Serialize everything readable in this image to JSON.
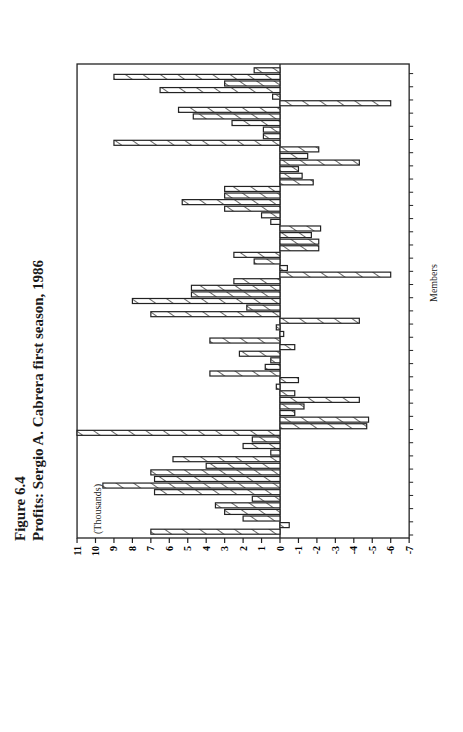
{
  "chart_data": {
    "type": "bar",
    "title": "Figure 6.4",
    "subtitle": "Profits: Sergio A. Cabrera first season, 1986",
    "xlabel": "Members",
    "ylabel": "(Thousands)",
    "ylim": [
      -7,
      11
    ],
    "yticks": [
      11,
      10,
      9,
      8,
      7,
      6,
      5,
      4,
      3,
      2,
      1,
      0,
      -1,
      -2,
      -3,
      -4,
      -5,
      -6,
      -7
    ],
    "grid": false,
    "legend": null,
    "orientation": "vertical bars, page rotated 90 degrees",
    "bar_style": "hatched",
    "categories_note": "individual members, unlabeled",
    "values": [
      7.0,
      -0.5,
      2.0,
      3.0,
      3.5,
      1.5,
      6.8,
      9.6,
      6.8,
      7.0,
      4.0,
      5.8,
      0.5,
      2.0,
      1.5,
      11.0,
      -4.7,
      -4.8,
      -0.8,
      -1.3,
      -4.3,
      -0.8,
      0.2,
      -1.0,
      3.8,
      0.8,
      0.5,
      2.2,
      -0.8,
      3.8,
      -0.2,
      0.2,
      -4.3,
      7.0,
      1.8,
      8.0,
      4.8,
      4.8,
      2.5,
      -6.0,
      -0.4,
      1.4,
      2.5,
      -2.1,
      -2.1,
      -1.7,
      -2.2,
      0.5,
      1.0,
      3.0,
      5.3,
      3.0,
      3.0,
      -1.8,
      -1.2,
      -1.0,
      -4.3,
      -1.5,
      -2.1,
      9.0,
      0.9,
      0.9,
      2.6,
      4.7,
      5.5,
      -6.0,
      0.4,
      6.5,
      3.0,
      9.0,
      1.4
    ]
  },
  "labels": {
    "figure": "Figure 6.4",
    "title": "Profits: Sergio A. Cabrera first season, 1986",
    "y_unit": "(Thousands)",
    "x_axis": "Members"
  }
}
